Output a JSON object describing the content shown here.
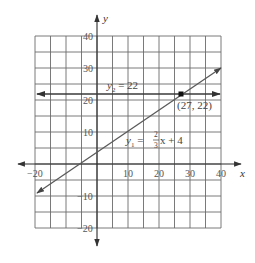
{
  "chart_data": {
    "type": "line",
    "title": "",
    "xlabel": "x",
    "ylabel": "y",
    "xlim": [
      -20,
      40
    ],
    "ylim": [
      -20,
      40
    ],
    "grid": true,
    "grid_step": 5,
    "x_ticks": [
      -20,
      10,
      20,
      30,
      40
    ],
    "x_tick_labels": [
      "−20",
      "10",
      "20",
      "30",
      "40"
    ],
    "y_ticks": [
      40,
      30,
      20,
      10,
      -10,
      -20
    ],
    "y_tick_labels": [
      "40",
      "30",
      "20",
      "10",
      "−10",
      "−20"
    ],
    "series": [
      {
        "name": "y1",
        "equation": "y1 = (2/3)x + 4",
        "label_main": "y",
        "label_sub": "1",
        "label_eq": " = ",
        "label_frac_num": "2",
        "label_frac_den": "3",
        "label_tail": "x + 4",
        "slope": 0.6667,
        "intercept": 4,
        "x": [
          -20,
          40
        ],
        "y": [
          -9.33,
          30.67
        ]
      },
      {
        "name": "y2",
        "equation": "y2 = 22",
        "label_main": "y",
        "label_sub": "2",
        "label_tail": " = 22",
        "slope": 0,
        "intercept": 22,
        "x": [
          -20,
          40
        ],
        "y": [
          22,
          22
        ]
      }
    ],
    "annotations": [
      {
        "type": "point",
        "x": 27,
        "y": 22,
        "label": "(27, 22)"
      }
    ]
  },
  "colors": {
    "background": "#ffffff",
    "grid": "#6b6b6b",
    "axis": "#2a2a2a",
    "line": "#4a4a4a",
    "point": "#111111"
  }
}
